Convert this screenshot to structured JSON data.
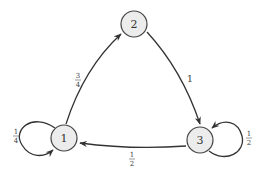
{
  "diagram": {
    "type": "markov-chain-state-diagram",
    "nodes": [
      {
        "id": "1",
        "label": "1"
      },
      {
        "id": "2",
        "label": "2"
      },
      {
        "id": "3",
        "label": "3"
      }
    ],
    "edges": [
      {
        "from": "1",
        "to": "1",
        "num": "1",
        "den": "4"
      },
      {
        "from": "1",
        "to": "2",
        "num": "3",
        "den": "4"
      },
      {
        "from": "2",
        "to": "3",
        "label": "1"
      },
      {
        "from": "3",
        "to": "3",
        "num": "1",
        "den": "2"
      },
      {
        "from": "3",
        "to": "1",
        "num": "1",
        "den": "2"
      }
    ]
  }
}
